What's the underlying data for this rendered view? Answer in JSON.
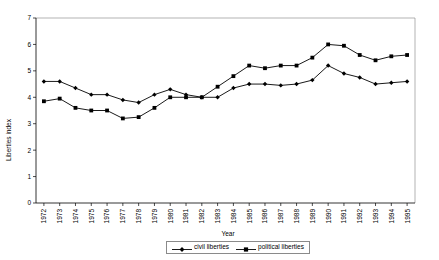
{
  "chart_data": {
    "type": "line",
    "title": "",
    "xlabel": "Year",
    "ylabel": "Liberties index",
    "x": [
      1972,
      1973,
      1974,
      1975,
      1976,
      1977,
      1978,
      1979,
      1980,
      1981,
      1982,
      1983,
      1984,
      1985,
      1986,
      1987,
      1988,
      1989,
      1990,
      1991,
      1992,
      1993,
      1994,
      1995
    ],
    "xtick_labels": [
      "1972",
      "1973",
      "1974",
      "1975",
      "1976",
      "1977",
      "1978",
      "1979",
      "1980",
      "1981",
      "1982",
      "1983",
      "1984",
      "1985",
      "1986",
      "1987",
      "1988",
      "1989",
      "1990",
      "1991",
      "1992",
      "1993",
      "1994",
      "1995"
    ],
    "ytick_labels": [
      "0",
      "1",
      "2",
      "3",
      "4",
      "5",
      "6",
      "7"
    ],
    "ylim": [
      0,
      7
    ],
    "ytick_values": [
      0,
      1,
      2,
      3,
      4,
      5,
      6,
      7
    ],
    "grid": false,
    "legend_position": "bottom-center",
    "series": [
      {
        "name": "civil liberties",
        "marker": "diamond",
        "color": "#000000",
        "values": [
          4.6,
          4.6,
          4.35,
          4.1,
          4.1,
          3.9,
          3.8,
          4.1,
          4.3,
          4.1,
          4.0,
          4.0,
          4.35,
          4.5,
          4.5,
          4.45,
          4.5,
          4.65,
          5.2,
          4.9,
          4.75,
          4.5,
          4.55,
          4.6
        ]
      },
      {
        "name": "political liberties",
        "marker": "square",
        "color": "#000000",
        "values": [
          3.85,
          3.95,
          3.6,
          3.5,
          3.5,
          3.2,
          3.25,
          3.6,
          4.0,
          4.0,
          4.0,
          4.4,
          4.8,
          5.2,
          5.1,
          5.2,
          5.2,
          5.5,
          6.0,
          5.95,
          5.6,
          5.4,
          5.55,
          5.6
        ]
      }
    ]
  },
  "legend": {
    "entries": [
      {
        "label": "civil liberties",
        "marker": "diamond-marker-icon"
      },
      {
        "label": "political liberties",
        "marker": "square-marker-icon"
      }
    ]
  }
}
